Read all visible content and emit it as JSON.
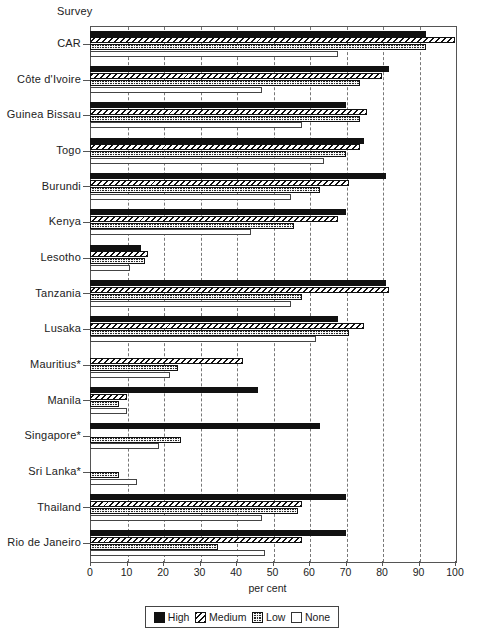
{
  "header": {
    "survey_label": "Survey"
  },
  "axis": {
    "x_title": "per cent",
    "x_ticks": [
      "0",
      "10",
      "20",
      "30",
      "40",
      "50",
      "60",
      "70",
      "80",
      "90",
      "100"
    ]
  },
  "legend": {
    "items": [
      {
        "label": "High",
        "key": "high",
        "swatch": "solid-black-swatch"
      },
      {
        "label": "Medium",
        "key": "medium",
        "swatch": "diagonal-hatch-swatch"
      },
      {
        "label": "Low",
        "key": "low",
        "swatch": "checkered-swatch"
      },
      {
        "label": "None",
        "key": "none",
        "swatch": "empty-white-swatch"
      }
    ]
  },
  "chart_data": {
    "type": "bar",
    "orientation": "horizontal",
    "title": "Survey",
    "xlabel": "per cent",
    "ylabel": "",
    "xlim": [
      0,
      100
    ],
    "xticks": [
      0,
      10,
      20,
      30,
      40,
      50,
      60,
      70,
      80,
      90,
      100
    ],
    "grid": true,
    "legend_position": "bottom",
    "categories": [
      "CAR",
      "Côte d'Ivoire",
      "Guinea Bissau",
      "Togo",
      "Burundi",
      "Kenya",
      "Lesotho",
      "Tanzania",
      "Lusaka",
      "Mauritius*",
      "Manila",
      "Singapore*",
      "Sri Lanka*",
      "Thailand",
      "Rio de Janeiro"
    ],
    "series": [
      {
        "name": "High",
        "values": [
          92,
          82,
          70,
          75,
          81,
          70,
          14,
          81,
          68,
          0,
          46,
          63,
          0,
          70,
          70
        ]
      },
      {
        "name": "Medium",
        "values": [
          100,
          80,
          76,
          74,
          71,
          68,
          16,
          82,
          75,
          42,
          10,
          0,
          0,
          58,
          58
        ]
      },
      {
        "name": "Low",
        "values": [
          92,
          74,
          74,
          70,
          63,
          56,
          15,
          58,
          71,
          24,
          8,
          25,
          8,
          57,
          35
        ]
      },
      {
        "name": "None",
        "values": [
          68,
          47,
          58,
          64,
          55,
          44,
          11,
          55,
          62,
          22,
          10,
          19,
          13,
          47,
          48
        ]
      }
    ]
  }
}
